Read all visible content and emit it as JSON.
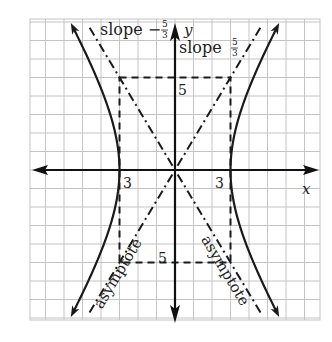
{
  "diagram": {
    "type": "hyperbola",
    "equation": "x^2/9 - y^2/25 = 1",
    "a": 3,
    "b": 5,
    "colors": {
      "grid": "#c4c4c4",
      "curve": "#1a1a1a",
      "axis": "#111111",
      "background": "#ffffff"
    },
    "labels": {
      "x_axis": "x",
      "y_axis": "y",
      "slope_neg_prefix": "slope −",
      "slope_pos_prefix": "slope ",
      "slope_num": "5",
      "slope_den": "3",
      "tick_x_left": "3",
      "tick_x_right": "3",
      "tick_y_top": "5",
      "tick_y_bottom": "5",
      "asymptote_left": "asymptote",
      "asymptote_right": "asymptote"
    },
    "asymptote_slopes": [
      -1.6667,
      1.6667
    ],
    "vertices": [
      [
        -3,
        0
      ],
      [
        3,
        0
      ]
    ],
    "rectangle": {
      "x": [
        -3,
        3
      ],
      "y": [
        -5,
        5
      ]
    }
  }
}
